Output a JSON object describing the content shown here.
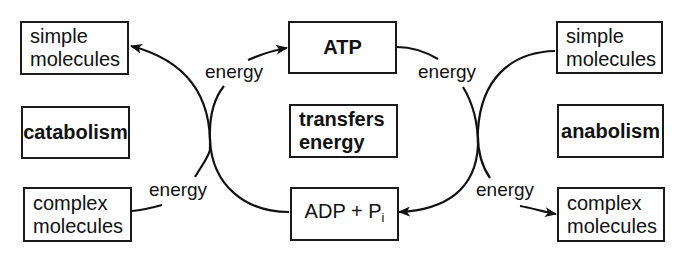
{
  "diagram": {
    "left": {
      "top_box": [
        "simple",
        "molecules"
      ],
      "process": "catabolism",
      "bottom_box": [
        "complex",
        "molecules"
      ]
    },
    "center": {
      "top_box": "ATP",
      "middle_box": [
        "transfers",
        "energy"
      ],
      "bottom_box": {
        "main": "ADP + P",
        "subscript": "i"
      }
    },
    "right": {
      "top_box": [
        "simple",
        "molecules"
      ],
      "process": "anabolism",
      "bottom_box": [
        "complex",
        "molecules"
      ]
    },
    "labels": {
      "energy_top_left": "energy",
      "energy_bottom_left": "energy",
      "energy_top_right": "energy",
      "energy_bottom_right": "energy"
    },
    "arrows": [
      {
        "from": "complex molecules (left)",
        "to": "simple molecules (left)",
        "label": "energy"
      },
      {
        "from": "ADP + Pi",
        "to": "ATP",
        "label": "energy"
      },
      {
        "from": "ATP",
        "to": "ADP + Pi",
        "label": "energy"
      },
      {
        "from": "simple molecules (right)",
        "to": "complex molecules (right)",
        "label": "energy"
      }
    ]
  }
}
